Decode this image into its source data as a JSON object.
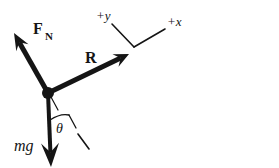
{
  "figure": {
    "type": "free-body-diagram",
    "background_color": "#ffffff",
    "ink_color": "#151515",
    "width": 279,
    "height": 168
  },
  "origin": {
    "label": "particle-origin",
    "x": 48,
    "y": 93,
    "radius": 6
  },
  "vectors": [
    {
      "id": "normal-force",
      "symbol": "F",
      "subscript": "N",
      "style": "bold",
      "from": {
        "x": 48,
        "y": 93
      },
      "to": {
        "x": 14,
        "y": 33
      },
      "label_x": 33,
      "label_y": 34,
      "sub_x": 45,
      "sub_y": 40
    },
    {
      "id": "resultant-force",
      "symbol": "R",
      "subscript": "",
      "style": "bold",
      "from": {
        "x": 48,
        "y": 93
      },
      "to": {
        "x": 129,
        "y": 54
      },
      "label_x": 85,
      "label_y": 63,
      "sub_x": 0,
      "sub_y": 0
    },
    {
      "id": "weight-force",
      "symbol": "mg",
      "subscript": "",
      "style": "italic",
      "from": {
        "x": 48,
        "y": 93
      },
      "to": {
        "x": 51,
        "y": 167
      },
      "label_x": 14,
      "label_y": 151,
      "sub_x": 0,
      "sub_y": 0
    }
  ],
  "axes": {
    "vertex": {
      "x": 134,
      "y": 47
    },
    "y_axis": {
      "id": "positive-y-axis",
      "label": "+y",
      "end": {
        "x": 112,
        "y": 24
      },
      "label_x": 96,
      "label_y": 20
    },
    "x_axis": {
      "id": "positive-x-axis",
      "label": "+x",
      "end": {
        "x": 165,
        "y": 29
      },
      "label_x": 167,
      "label_y": 26
    }
  },
  "angle": {
    "id": "theta-angle",
    "label": "θ",
    "label_x": 56,
    "label_y": 133,
    "arc_from": {
      "x": 50,
      "y": 120
    },
    "arc_to": {
      "x": 69,
      "y": 115
    },
    "tick_from": {
      "x": 69,
      "y": 115
    },
    "tick_to": {
      "x": 76,
      "y": 128
    }
  },
  "incline_marks": [
    {
      "id": "incline-mark-origin",
      "from": {
        "x": 51,
        "y": 97
      },
      "to": {
        "x": 58,
        "y": 110
      }
    },
    {
      "id": "incline-mark-lower",
      "from": {
        "x": 78,
        "y": 134
      },
      "to": {
        "x": 89,
        "y": 149
      }
    }
  ]
}
